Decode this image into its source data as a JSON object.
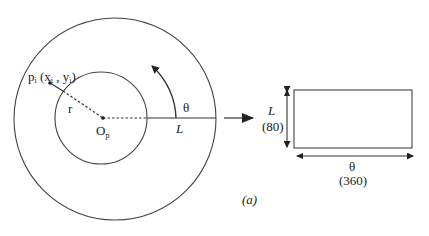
{
  "diagram": {
    "caption": "(a)",
    "point_label": "p",
    "point_sub": "i",
    "point_coords_open": " (x",
    "point_coords_xsub": "i",
    "point_coords_mid": " , y",
    "point_coords_ysub": "i",
    "point_coords_close": ")",
    "radius_label": "r",
    "center_label": "O",
    "center_sub": "p",
    "angle_label": "θ",
    "length_label": "L",
    "rect_height_label": "L",
    "rect_height_value": "(80)",
    "rect_width_label": "θ",
    "rect_width_value": "(360)"
  },
  "colors": {
    "stroke": "#333333",
    "background": "#ffffff"
  }
}
